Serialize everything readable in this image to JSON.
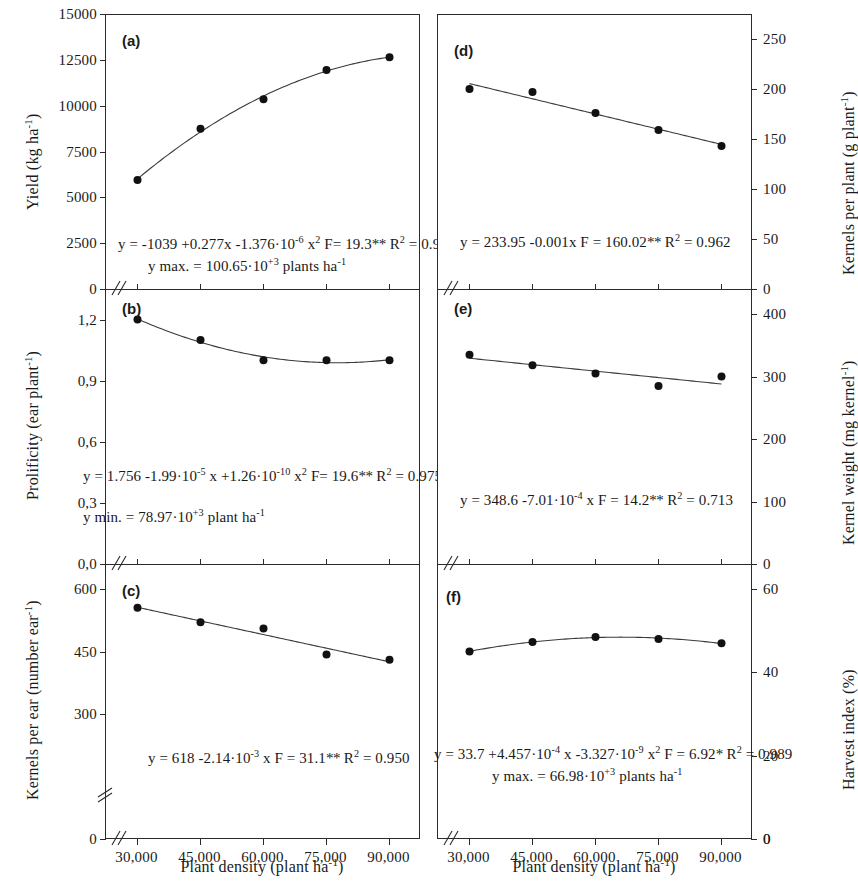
{
  "figure": {
    "xaxis_title": "Plant density (plant ha",
    "xaxis_title_sup": "-1",
    "xaxis_title_tail": ")",
    "xticks": [
      "30,000",
      "45,000",
      "60,000",
      "75,000",
      "90,000"
    ],
    "xvalues": [
      30000,
      45000,
      60000,
      75000,
      90000
    ],
    "axis_break_symbol": "//",
    "zero_label": "0"
  },
  "panels": {
    "a": {
      "letter": "(a)",
      "ylabel_main": "Yield (kg ha",
      "ylabel_sup": "-1",
      "ylabel_tail": ")",
      "yticks": [
        "0",
        "2500",
        "5000",
        "7500",
        "10000",
        "12500",
        "15000"
      ],
      "eq_line1": "y = -1039 +0.277x -1.376·10",
      "eq_line1_sup1": "-6",
      "eq_line1_b": " x",
      "eq_line1_sup2": "2",
      "eq_line1_c": "  F= 19.3",
      "eq_line1_stars": "**",
      "eq_line1_d": "  R",
      "eq_line1_sup3": "2",
      "eq_line1_e": " = 0.997",
      "eq_line2_a": "y max. = 100.65·10",
      "eq_line2_sup": "+3",
      "eq_line2_b": " plants ha",
      "eq_line2_sup2": "-1"
    },
    "b": {
      "letter": "(b)",
      "ylabel_main": "Prolificity (ear plant",
      "ylabel_sup": "-1",
      "ylabel_tail": ")",
      "yticks": [
        "0,0",
        "0,3",
        "0,6",
        "0,9",
        "1,2"
      ],
      "eq_line1": "y = 1.756 -1.99·10",
      "eq_line1_sup1": "-5",
      "eq_line1_b": " x +1.26·10",
      "eq_line1_sup2": "-10",
      "eq_line1_c": " x",
      "eq_line1_sup3": "2",
      "eq_line1_d": " F= 19.6",
      "eq_line1_stars": "**",
      "eq_line1_e": " R",
      "eq_line1_sup4": "2",
      "eq_line1_f": " = 0.975",
      "eq_line2_a": "y min. = 78.97·10",
      "eq_line2_sup": "+3",
      "eq_line2_b": " plant ha",
      "eq_line2_sup2": "-1"
    },
    "c": {
      "letter": "(c)",
      "ylabel_main": "Kernels per ear (number ear",
      "ylabel_sup": "-1",
      "ylabel_tail": ")",
      "yticks": [
        "0",
        "300",
        "450",
        "600"
      ],
      "eq_line1": "y = 618 -2.14·10",
      "eq_line1_sup1": "-3",
      "eq_line1_b": " x  F = 31.1",
      "eq_line1_stars": "**",
      "eq_line1_c": "  R",
      "eq_line1_sup2": "2",
      "eq_line1_d": " = 0.950"
    },
    "d": {
      "letter": "(d)",
      "ylabel_main": "Kernels per plant  (g plant",
      "ylabel_sup": "-1",
      "ylabel_tail": ")",
      "yticks": [
        "0",
        "50",
        "100",
        "150",
        "200",
        "250"
      ],
      "eq_line1": "y = 233.95 -0.001x  F = 160.02",
      "eq_line1_stars": "**",
      "eq_line1_b": "   R",
      "eq_line1_sup": "2",
      "eq_line1_c": " = 0.962"
    },
    "e": {
      "letter": "(e)",
      "ylabel_main": "Kernel weight  (mg kernel",
      "ylabel_sup": "-1",
      "ylabel_tail": ")",
      "yticks": [
        "0",
        "100",
        "200",
        "300",
        "400"
      ],
      "eq_line1": "y = 348.6 -7.01·10",
      "eq_line1_sup1": "-4",
      "eq_line1_b": " x   F = 14.2",
      "eq_line1_stars": "**",
      "eq_line1_c": "  R",
      "eq_line1_sup2": "2",
      "eq_line1_d": " = 0.713"
    },
    "f": {
      "letter": "(f)",
      "ylabel_main": "Harvest index (%)",
      "ylabel_sup": "",
      "ylabel_tail": "",
      "yticks": [
        "0",
        "20",
        "40",
        "60"
      ],
      "eq_line1": "y = 33.7 +4.457·10",
      "eq_line1_sup1": "-4",
      "eq_line1_b": " x -3.327·10",
      "eq_line1_sup2": "-9",
      "eq_line1_c": " x",
      "eq_line1_sup3": "2",
      "eq_line1_d": "  F = 6.92",
      "eq_line1_stars": "*",
      "eq_line1_e": "  R",
      "eq_line1_sup4": "2",
      "eq_line1_f": " = 0.989",
      "eq_line2_a": "y max. = 66.98·10",
      "eq_line2_sup": "+3",
      "eq_line2_b": " plants ha",
      "eq_line2_sup2": "-1"
    }
  },
  "chart_data": [
    {
      "type": "scatter",
      "panel": "a",
      "title": "(a)",
      "xlabel": "Plant density (plant ha-1)",
      "ylabel": "Yield (kg ha-1)",
      "x": [
        30000,
        45000,
        60000,
        75000,
        90000
      ],
      "values": [
        6000,
        8800,
        10400,
        12000,
        12700
      ],
      "ylim": [
        0,
        15000
      ],
      "yticks": [
        0,
        2500,
        5000,
        7500,
        10000,
        12500,
        15000
      ],
      "xlim": [
        22500,
        97500
      ],
      "fit": "quadratic",
      "equation": "y = -1039 +0.277x -1.376e-6 x^2",
      "F": "19.3**",
      "R2": 0.997,
      "note": "y max. = 100.65e+3 plants ha-1",
      "grid": false,
      "legend": "none"
    },
    {
      "type": "scatter",
      "panel": "b",
      "title": "(b)",
      "xlabel": "Plant density (plant ha-1)",
      "ylabel": "Prolificity (ear plant-1)",
      "x": [
        30000,
        45000,
        60000,
        75000,
        90000
      ],
      "values": [
        1.2,
        1.1,
        1.0,
        1.0,
        1.0
      ],
      "ylim": [
        0,
        1.35
      ],
      "yticks": [
        0.0,
        0.3,
        0.6,
        0.9,
        1.2
      ],
      "xlim": [
        22500,
        97500
      ],
      "fit": "quadratic",
      "equation": "y = 1.756 -1.99e-5 x +1.26e-10 x^2",
      "F": "19.6**",
      "R2": 0.975,
      "note": "y min. = 78.97e+3 plant ha-1",
      "grid": false,
      "legend": "none"
    },
    {
      "type": "scatter",
      "panel": "c",
      "title": "(c)",
      "xlabel": "Plant density (plant ha-1)",
      "ylabel": "Kernels per ear (number ear-1)",
      "x": [
        30000,
        45000,
        60000,
        75000,
        90000
      ],
      "values": [
        555,
        520,
        505,
        443,
        430
      ],
      "ylim": [
        0,
        660
      ],
      "yticks": [
        0,
        300,
        450,
        600
      ],
      "xlim": [
        22500,
        97500
      ],
      "fit": "linear",
      "equation": "y = 618 -2.14e-3 x",
      "F": "31.1**",
      "R2": 0.95,
      "grid": false,
      "legend": "none"
    },
    {
      "type": "scatter",
      "panel": "d",
      "title": "(d)",
      "xlabel": "Plant density (plant ha-1)",
      "ylabel": "Kernels per plant (g plant-1)",
      "x": [
        30000,
        45000,
        60000,
        75000,
        90000
      ],
      "values": [
        201,
        198,
        177,
        160,
        144
      ],
      "ylim": [
        0,
        275
      ],
      "yticks": [
        0,
        50,
        100,
        150,
        200,
        250
      ],
      "xlim": [
        22500,
        97500
      ],
      "fit": "linear",
      "equation": "y = 233.95 -0.001x",
      "F": "160.02**",
      "R2": 0.962,
      "grid": false,
      "legend": "none"
    },
    {
      "type": "scatter",
      "panel": "e",
      "title": "(e)",
      "xlabel": "Plant density (plant ha-1)",
      "ylabel": "Kernel weight (mg kernel-1)",
      "x": [
        30000,
        45000,
        60000,
        75000,
        90000
      ],
      "values": [
        335,
        318,
        305,
        285,
        300
      ],
      "ylim": [
        0,
        440
      ],
      "yticks": [
        0,
        100,
        200,
        300,
        400
      ],
      "xlim": [
        22500,
        97500
      ],
      "fit": "linear",
      "equation": "y = 348.6 -7.01e-4 x",
      "F": "14.2**",
      "R2": 0.713,
      "grid": false,
      "legend": "none"
    },
    {
      "type": "scatter",
      "panel": "f",
      "title": "(f)",
      "xlabel": "Plant density (plant ha-1)",
      "ylabel": "Harvest index (%)",
      "x": [
        30000,
        45000,
        60000,
        75000,
        90000
      ],
      "values": [
        45.0,
        47.3,
        48.5,
        48.0,
        47.0
      ],
      "ylim": [
        0,
        66
      ],
      "yticks": [
        0,
        20,
        40,
        60
      ],
      "xlim": [
        22500,
        97500
      ],
      "fit": "quadratic",
      "equation": "y = 33.7 +4.457e-4 x -3.327e-9 x^2",
      "F": "6.92*",
      "R2": 0.989,
      "note": "y max. = 66.98e+3 plants ha-1",
      "grid": false,
      "legend": "none"
    }
  ]
}
